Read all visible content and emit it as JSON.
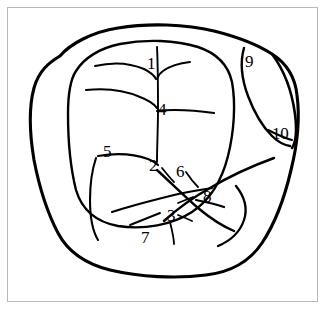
{
  "figure": {
    "type": "line-drawing",
    "background_color": "#ffffff",
    "ink_color": "#000000",
    "frame_color": "#b9b9b9",
    "frame": {
      "visible": true,
      "left": 7,
      "top": 7,
      "width": 311,
      "height": 295
    },
    "labels": [
      {
        "id": "label-1",
        "text": "1",
        "x": 147,
        "y": 55
      },
      {
        "id": "label-9",
        "text": "9",
        "x": 245,
        "y": 53
      },
      {
        "id": "label-4",
        "text": "4",
        "x": 158,
        "y": 101
      },
      {
        "id": "label-10",
        "text": "10",
        "x": 272,
        "y": 125
      },
      {
        "id": "label-5",
        "text": "5",
        "x": 103,
        "y": 143
      },
      {
        "id": "label-2",
        "text": "2",
        "x": 149,
        "y": 157
      },
      {
        "id": "label-6",
        "text": "6",
        "x": 176,
        "y": 163
      },
      {
        "id": "label-8",
        "text": "8",
        "x": 203,
        "y": 188
      },
      {
        "id": "label-3",
        "text": "3",
        "x": 167,
        "y": 207
      },
      {
        "id": "label-7",
        "text": "7",
        "x": 141,
        "y": 229
      }
    ],
    "strokes": {
      "outer_contour": "M 60 56 C 70 44, 92 32, 118 28 C 148 23, 186 24, 214 31 C 238 37, 258 45, 272 54 C 286 63, 295 76, 297 95 C 300 118, 297 146, 291 170 C 285 196, 276 222, 262 243 C 250 261, 232 272, 206 275 C 176 279, 140 277, 110 270 C 86 264, 68 252, 58 233 C 47 212, 39 186, 34 160 C 30 136, 28 110, 34 88 C 39 70, 50 62, 60 56 Z",
      "inner_contour": "M 76 71 C 84 58, 100 48, 120 44 C 146 39, 176 40, 198 47 C 216 53, 228 64, 232 82 C 236 104, 234 132, 228 156 C 222 180, 210 200, 192 212 C 172 225, 144 230, 118 226 C 96 222, 82 210, 76 190 C 70 166, 68 138, 68 114 C 68 96, 70 80, 76 71 Z",
      "midrib": "M 157 47 C 158 66, 158 88, 158 110 C 158 128, 157 146, 157 162",
      "vein_upper_left": "M 95 66 C 112 62, 130 63, 144 69 C 150 72, 154 75, 156 79",
      "vein_upper_right": "M 190 62 C 180 63, 170 66, 163 71 C 160 73, 158 76, 157 79",
      "vein_mid_left": "M 86 90 C 105 88, 124 90, 140 97 C 148 100, 154 104, 157 108",
      "vein_mid_right": "M 214 113 C 200 111, 186 110, 175 110 C 167 110, 161 110, 157 111",
      "vein_lower_left": "M 98 156 C 116 153, 134 154, 148 159 C 153 161, 156 163, 158 165",
      "region_5_border": "M 96 158 C 92 170, 90 186, 90 200 C 90 216, 92 230, 98 240",
      "band_line": "M 112 212 C 130 206, 150 201, 170 196 C 186 192, 200 190, 212 188",
      "diagonal_major": "M 157 170 C 170 182, 184 196, 198 208 C 210 218, 222 226, 234 231",
      "ridge_long": "M 274 158 C 252 166, 230 176, 210 188 C 192 198, 176 210, 164 221",
      "crescent_outer": "M 236 186 C 244 196, 248 208, 244 220 C 240 232, 230 241, 218 246",
      "crescent_inner": "M 196 200 C 206 202, 216 204, 224 207",
      "ridge_short_7": "M 130 225 C 140 221, 150 217, 160 213",
      "tick_3a": "M 178 203 C 183 201, 188 199, 193 197",
      "tick_3b": "M 178 215 C 183 217, 188 219, 192 221",
      "tick_3c": "M 170 222 C 172 230, 174 238, 174 244",
      "tick_2": "M 162 168 C 166 173, 170 178, 174 182",
      "tick_6": "M 186 172 C 190 178, 194 183, 198 187",
      "lobe_9_10_inner": "M 244 48 C 240 62, 242 80, 248 96 C 254 112, 262 126, 272 136 C 278 142, 284 145, 290 146",
      "lobe_9_10_outer": "M 272 54 C 284 70, 292 92, 295 114 C 297 130, 296 142, 292 148",
      "notch_10": "M 268 130 C 276 134, 284 138, 292 140"
    }
  }
}
